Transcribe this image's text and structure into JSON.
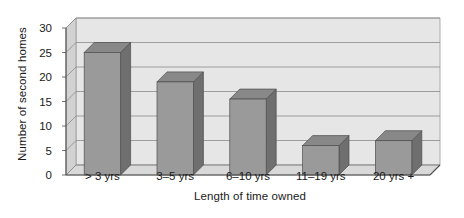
{
  "chart_data": {
    "type": "bar",
    "title": "",
    "subtitle": "",
    "xlabel": "Length of time owned",
    "ylabel": "Number of second homes",
    "categories": [
      "> 3 yrs",
      "3–5 yrs",
      "6–10 yrs",
      "11–19 yrs",
      "20 yrs +"
    ],
    "values": [
      25,
      19,
      15.5,
      6,
      7
    ],
    "ylim": [
      0,
      30
    ],
    "yticks": [
      0,
      5,
      10,
      15,
      20,
      25,
      30
    ],
    "ytick_labels": [
      "0",
      "5",
      "10",
      "15",
      "20",
      "25",
      "30"
    ],
    "grid": true,
    "grid_axis": "y",
    "legend": false,
    "legend_position": "none",
    "style": "3d-column",
    "series": [
      {
        "name": "Number of second homes",
        "values": [
          25,
          19,
          15.5,
          6,
          7
        ]
      }
    ]
  },
  "colors": {
    "bar_front": "#9a9a9a",
    "bar_side": "#6f6f6f",
    "bar_top": "#888888",
    "floor": "#d9d9d9",
    "back_wall": "#e6e6e6",
    "side_wall": "#d2d2d2",
    "gridline": "#8a8a8a",
    "axis_line": "#4d4d4d",
    "text": "#1a1a1a",
    "background": "#ffffff"
  }
}
